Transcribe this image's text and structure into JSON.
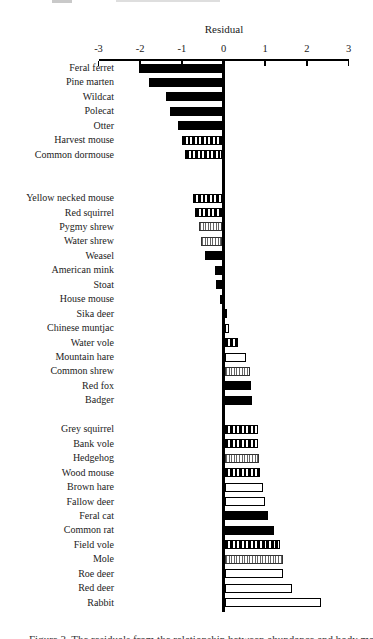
{
  "figure": {
    "caption_partial": "Figure 3.  The residuals from the relationship between abundance and body mass for the species considered"
  },
  "chart_data": {
    "type": "bar",
    "orientation": "horizontal",
    "title": "Residual",
    "xlabel": "Residual",
    "ylabel": "",
    "xlim": [
      -3,
      3
    ],
    "x_ticks": [
      "-3",
      "-2",
      "-1",
      "0",
      "1",
      "2",
      "3"
    ],
    "x_tick_values": [
      -3,
      -2,
      -1,
      0,
      1,
      2,
      3
    ],
    "grid": false,
    "legend_position": "none",
    "fill_styles": {
      "black": "#000000",
      "white": "#ffffff",
      "stripes-bold": "vertical black hatch, wide",
      "stripes-fine": "vertical gray hatch, fine"
    },
    "gap_rows_after_groups": [
      2,
      1,
      0
    ],
    "groups": [
      [
        {
          "label": "Feral ferret",
          "value": -2.0,
          "fill": "black"
        },
        {
          "label": "Pine marten",
          "value": -1.75,
          "fill": "black"
        },
        {
          "label": "Wildcat",
          "value": -1.35,
          "fill": "black"
        },
        {
          "label": "Polecat",
          "value": -1.25,
          "fill": "black"
        },
        {
          "label": "Otter",
          "value": -1.05,
          "fill": "black"
        },
        {
          "label": "Harvest mouse",
          "value": -0.95,
          "fill": "stripes-bold"
        },
        {
          "label": "Common dormouse",
          "value": -0.9,
          "fill": "stripes-bold"
        }
      ],
      [
        {
          "label": "Yellow necked mouse",
          "value": -0.7,
          "fill": "stripes-bold"
        },
        {
          "label": "Red squirrel",
          "value": -0.65,
          "fill": "stripes-bold"
        },
        {
          "label": "Pygmy shrew",
          "value": -0.55,
          "fill": "stripes-fine"
        },
        {
          "label": "Water shrew",
          "value": -0.5,
          "fill": "stripes-fine"
        },
        {
          "label": "Weasel",
          "value": -0.4,
          "fill": "black"
        },
        {
          "label": "American mink",
          "value": -0.18,
          "fill": "black"
        },
        {
          "label": "Stoat",
          "value": -0.14,
          "fill": "black"
        },
        {
          "label": "House mouse",
          "value": -0.05,
          "fill": "black"
        },
        {
          "label": "Sika deer",
          "value": 0.05,
          "fill": "black"
        },
        {
          "label": "Chinese muntjac",
          "value": 0.1,
          "fill": "white"
        },
        {
          "label": "Water vole",
          "value": 0.3,
          "fill": "stripes-bold"
        },
        {
          "label": "Mountain hare",
          "value": 0.5,
          "fill": "white"
        },
        {
          "label": "Common shrew",
          "value": 0.6,
          "fill": "stripes-fine"
        },
        {
          "label": "Red fox",
          "value": 0.62,
          "fill": "black"
        },
        {
          "label": "Badger",
          "value": 0.65,
          "fill": "black"
        }
      ],
      [
        {
          "label": "Grey squirrel",
          "value": 0.78,
          "fill": "stripes-bold"
        },
        {
          "label": "Bank vole",
          "value": 0.8,
          "fill": "stripes-bold"
        },
        {
          "label": "Hedgehog",
          "value": 0.82,
          "fill": "stripes-fine"
        },
        {
          "label": "Wood mouse",
          "value": 0.85,
          "fill": "stripes-bold"
        },
        {
          "label": "Brown hare",
          "value": 0.92,
          "fill": "white"
        },
        {
          "label": "Fallow deer",
          "value": 0.95,
          "fill": "white"
        },
        {
          "label": "Feral cat",
          "value": 1.02,
          "fill": "black"
        },
        {
          "label": "Common rat",
          "value": 1.18,
          "fill": "black"
        },
        {
          "label": "Field vole",
          "value": 1.32,
          "fill": "stripes-bold"
        },
        {
          "label": "Mole",
          "value": 1.38,
          "fill": "stripes-fine"
        },
        {
          "label": "Roe deer",
          "value": 1.4,
          "fill": "white"
        },
        {
          "label": "Red deer",
          "value": 1.6,
          "fill": "white"
        },
        {
          "label": "Rabbit",
          "value": 2.3,
          "fill": "white"
        }
      ]
    ]
  }
}
